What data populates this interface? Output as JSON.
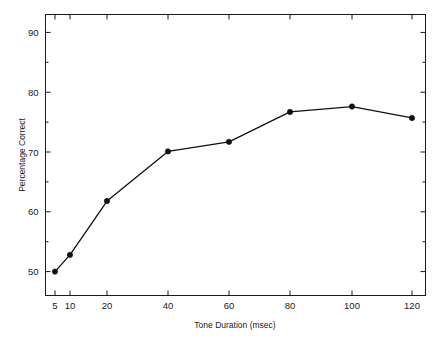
{
  "chart_data": {
    "type": "line",
    "title": "",
    "xlabel": "Tone Duration (msec)",
    "ylabel": "Percentage Correct",
    "x": [
      5,
      10,
      20,
      40,
      60,
      80,
      100,
      120
    ],
    "values": [
      50.0,
      52.8,
      61.8,
      70.1,
      71.7,
      76.7,
      77.6,
      75.7
    ],
    "series": [
      {
        "name": "Percentage Correct",
        "values": [
          50.0,
          52.8,
          61.8,
          70.1,
          71.7,
          76.7,
          77.6,
          75.7
        ]
      }
    ],
    "xtick_labels": [
      "5",
      "10",
      "20",
      "40",
      "60",
      "80",
      "100",
      "120"
    ],
    "ytick_labels": [
      "50",
      "60",
      "70",
      "80",
      "90"
    ],
    "ytick_values": [
      50,
      60,
      70,
      80,
      90
    ],
    "ylim": [
      46,
      93
    ],
    "grid": false,
    "legend": "none",
    "marker": "filled-circle",
    "line_color": "#111111",
    "frame_color": "#1a1a1a",
    "background_color": "#ffffff"
  },
  "axes": {
    "x_title": "Tone Duration (msec)",
    "y_title": "Percentage Correct"
  }
}
